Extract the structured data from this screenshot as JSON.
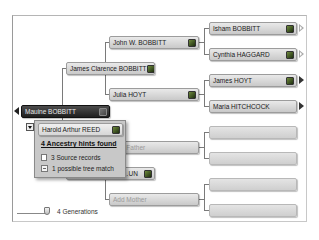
{
  "pedigree": {
    "root": {
      "name": "Mauine BOBBITT",
      "has_leaf_hint": true
    },
    "spouse": {
      "name": "Harold Arthur REED",
      "has_leaf_hint": true
    },
    "generation2": [
      {
        "name": "James Clarence BOBBITT",
        "has_leaf_hint": true
      },
      {
        "name": "…UN",
        "has_leaf_hint": true
      }
    ],
    "generation3": [
      {
        "name": "John W. BOBBITT",
        "has_leaf_hint": true
      },
      {
        "name": "Julia HOYT",
        "has_leaf_hint": true
      },
      {
        "name": "Add Father",
        "placeholder": true
      },
      {
        "name": "Add Mother",
        "placeholder": true
      }
    ],
    "generation4": [
      {
        "name": "Isham BOBBITT",
        "has_leaf_hint": true,
        "arrow": "hollow"
      },
      {
        "name": "Cynthia HAGGARD",
        "has_leaf_hint": true,
        "arrow": "hollow"
      },
      {
        "name": "James HOYT",
        "has_leaf_hint": true,
        "arrow": "filled"
      },
      {
        "name": "Maria HITCHCOCK",
        "has_leaf_hint": false,
        "arrow": "filled"
      },
      {
        "name": "",
        "empty": true
      },
      {
        "name": "",
        "empty": true
      },
      {
        "name": "",
        "empty": true
      },
      {
        "name": "",
        "empty": true
      }
    ]
  },
  "hints_popup": {
    "spouse_name": "Harold Arthur REED",
    "title": "4 Ancestry hints found",
    "items": [
      {
        "icon": "document-icon",
        "label": "3 Source records"
      },
      {
        "icon": "tree-match-icon",
        "label": "1 possible tree match"
      }
    ]
  },
  "generations_slider": {
    "label": "4 Generations",
    "value": 4
  },
  "colors": {
    "root_node": "#2a2a2a",
    "node": "#d4d4d4",
    "leaf_hint": "#4a6a2a"
  }
}
